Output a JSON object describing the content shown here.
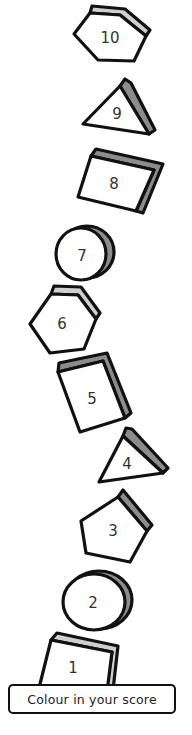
{
  "worksheet": {
    "instruction": "Colour in your score",
    "colors": {
      "outline": "#111111",
      "shadow_dark": "#8c8c8c",
      "shadow_light": "#cfcfcf",
      "fill": "#ffffff"
    },
    "shapes": [
      {
        "number": "10",
        "type": "hexagon"
      },
      {
        "number": "9",
        "type": "triangle"
      },
      {
        "number": "8",
        "type": "square"
      },
      {
        "number": "7",
        "type": "circle"
      },
      {
        "number": "6",
        "type": "hexagon"
      },
      {
        "number": "5",
        "type": "square"
      },
      {
        "number": "4",
        "type": "triangle"
      },
      {
        "number": "3",
        "type": "pentagon"
      },
      {
        "number": "2",
        "type": "circle"
      },
      {
        "number": "1",
        "type": "square"
      }
    ]
  }
}
